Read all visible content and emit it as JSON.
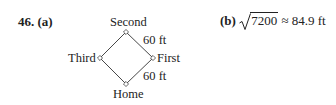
{
  "problem": {
    "number": "46.",
    "part_a_label": "(a)",
    "part_b_label": "(b)"
  },
  "diagram": {
    "bases": {
      "top": "Second",
      "left": "Third",
      "right": "First",
      "bottom": "Home"
    },
    "side_labels": {
      "upper_right": "60 ft",
      "lower_right": "60 ft"
    }
  },
  "answer_b": {
    "radicand": "7200",
    "approx_symbol": "≈",
    "value": "84.9 ft"
  }
}
